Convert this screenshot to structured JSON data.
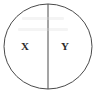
{
  "figure": {
    "background_color": "#ffffff",
    "stroke_color": "#4a4a4a",
    "label_color": "#2b2b2b",
    "canvas": {
      "width": 95,
      "height": 94
    },
    "circle": {
      "name": "outer-circle",
      "center_x": 48,
      "center_y": 46.5,
      "radius_x": 44,
      "radius_y": 42.5,
      "stroke_width": 1
    },
    "divider": {
      "name": "vertical-divider",
      "x": 48,
      "y_top": 4,
      "y_bottom": 89,
      "stroke_width": 1
    },
    "regions": [
      {
        "id": "left",
        "label": "X",
        "cx": 25,
        "cy": 45.5
      },
      {
        "id": "right",
        "label": "Y",
        "cx": 65,
        "cy": 45.5
      }
    ]
  }
}
